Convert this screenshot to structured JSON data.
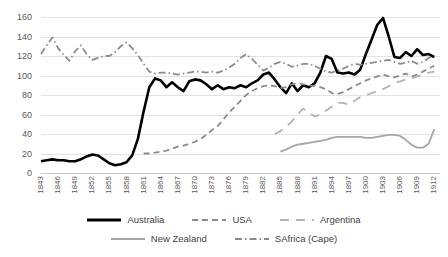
{
  "chart_data": {
    "type": "line",
    "title": "",
    "subtitle": "",
    "xlabel": "",
    "ylabel": "",
    "xlim": [
      1843,
      1913
    ],
    "ylim": [
      0,
      160
    ],
    "y_ticks": [
      0,
      20,
      40,
      60,
      80,
      100,
      120,
      140,
      160
    ],
    "grid": true,
    "legend_position": "bottom",
    "x_tick_labels": [
      "1843",
      "1846",
      "1849",
      "1852",
      "1855",
      "1858",
      "1861",
      "1864",
      "1867",
      "1870",
      "1873",
      "1876",
      "1879",
      "1882",
      "1885",
      "1888",
      "1891",
      "1894",
      "1897",
      "1900",
      "1903",
      "1906",
      "1909",
      "1912"
    ],
    "x_tick_values": [
      1843,
      1846,
      1849,
      1852,
      1855,
      1858,
      1861,
      1864,
      1867,
      1870,
      1873,
      1876,
      1879,
      1882,
      1885,
      1888,
      1891,
      1894,
      1897,
      1900,
      1903,
      1906,
      1909,
      1912
    ],
    "series": [
      {
        "name": "Australia",
        "color": "#000000",
        "style": "solid",
        "width": 2.6,
        "x": [
          1843,
          1844,
          1845,
          1846,
          1847,
          1848,
          1849,
          1850,
          1851,
          1852,
          1853,
          1854,
          1855,
          1856,
          1857,
          1858,
          1859,
          1860,
          1861,
          1862,
          1863,
          1864,
          1865,
          1866,
          1867,
          1868,
          1869,
          1870,
          1871,
          1872,
          1873,
          1874,
          1875,
          1876,
          1877,
          1878,
          1879,
          1880,
          1881,
          1882,
          1883,
          1884,
          1885,
          1886,
          1887,
          1888,
          1889,
          1890,
          1891,
          1892,
          1893,
          1894,
          1895,
          1896,
          1897,
          1898,
          1899,
          1900,
          1901,
          1902,
          1903,
          1904,
          1905,
          1906,
          1907,
          1908,
          1909,
          1910,
          1911,
          1912
        ],
        "y": [
          12,
          13,
          14,
          13,
          13,
          12,
          12,
          14,
          17,
          19,
          18,
          14,
          10,
          8,
          9,
          11,
          18,
          35,
          63,
          88,
          97,
          95,
          88,
          93,
          88,
          84,
          94,
          96,
          95,
          91,
          86,
          90,
          86,
          88,
          87,
          90,
          88,
          92,
          95,
          101,
          103,
          96,
          88,
          82,
          92,
          84,
          90,
          88,
          92,
          103,
          120,
          117,
          103,
          102,
          103,
          101,
          106,
          122,
          137,
          152,
          159,
          140,
          119,
          118,
          124,
          120,
          127,
          121,
          122,
          119
        ]
      },
      {
        "name": "USA",
        "color": "#8c8c8c",
        "style": "dashed",
        "width": 1.8,
        "x": [
          1861,
          1862,
          1863,
          1864,
          1865,
          1866,
          1867,
          1868,
          1869,
          1870,
          1871,
          1872,
          1873,
          1874,
          1875,
          1876,
          1877,
          1878,
          1879,
          1880,
          1881,
          1882,
          1883,
          1884,
          1885,
          1886,
          1887,
          1888,
          1889,
          1890,
          1891,
          1892,
          1893,
          1894,
          1895,
          1896,
          1897,
          1898,
          1899,
          1900,
          1901,
          1902,
          1903,
          1904,
          1905,
          1906,
          1907,
          1908,
          1909,
          1910,
          1911,
          1912
        ],
        "y": [
          20,
          20,
          21,
          22,
          23,
          25,
          27,
          28,
          30,
          32,
          35,
          39,
          44,
          48,
          55,
          62,
          68,
          74,
          80,
          84,
          87,
          89,
          90,
          89,
          87,
          88,
          91,
          92,
          91,
          90,
          89,
          88,
          86,
          82,
          81,
          83,
          86,
          89,
          92,
          95,
          97,
          99,
          101,
          99,
          98,
          100,
          102,
          99,
          101,
          104,
          107,
          110
        ]
      },
      {
        "name": "Argentina",
        "color": "#b3b3b3",
        "style": "longdash",
        "width": 1.8,
        "x": [
          1884,
          1885,
          1886,
          1887,
          1888,
          1889,
          1890,
          1891,
          1892,
          1893,
          1894,
          1895,
          1896,
          1897,
          1898,
          1899,
          1900,
          1901,
          1902,
          1903,
          1904,
          1905,
          1906,
          1907,
          1908,
          1909,
          1910,
          1911,
          1912
        ],
        "y": [
          40,
          43,
          47,
          53,
          60,
          66,
          62,
          58,
          60,
          64,
          68,
          72,
          72,
          70,
          74,
          78,
          80,
          82,
          84,
          86,
          89,
          92,
          94,
          96,
          97,
          99,
          101,
          103,
          104
        ]
      },
      {
        "name": "New Zealand",
        "color": "#a6a6a6",
        "style": "solid",
        "width": 1.8,
        "x": [
          1885,
          1886,
          1887,
          1888,
          1889,
          1890,
          1891,
          1892,
          1893,
          1894,
          1895,
          1896,
          1897,
          1898,
          1899,
          1900,
          1901,
          1902,
          1903,
          1904,
          1905,
          1906,
          1907,
          1908,
          1909,
          1910,
          1911,
          1912
        ],
        "y": [
          22,
          24,
          27,
          29,
          30,
          31,
          32,
          33,
          34,
          36,
          37,
          37,
          37,
          37,
          37,
          36,
          36,
          37,
          38,
          39,
          39,
          38,
          34,
          29,
          26,
          26,
          30,
          45
        ]
      },
      {
        "name": "SAfrica (Cape)",
        "color": "#8c8c8c",
        "style": "dashdot",
        "width": 1.8,
        "x": [
          1843,
          1844,
          1845,
          1846,
          1847,
          1848,
          1849,
          1850,
          1851,
          1852,
          1853,
          1854,
          1855,
          1856,
          1857,
          1858,
          1859,
          1860,
          1861,
          1862,
          1863,
          1864,
          1865,
          1866,
          1867,
          1868,
          1869,
          1870,
          1871,
          1872,
          1873,
          1874,
          1875,
          1876,
          1877,
          1878,
          1879,
          1880,
          1881,
          1882,
          1883,
          1884,
          1885,
          1886,
          1887,
          1888,
          1889,
          1890,
          1891,
          1892,
          1893,
          1894,
          1895,
          1896,
          1897,
          1898,
          1899,
          1900,
          1901,
          1902,
          1903,
          1904,
          1905,
          1906,
          1907,
          1908,
          1909,
          1910,
          1911,
          1912
        ],
        "y": [
          122,
          131,
          139,
          128,
          121,
          115,
          125,
          131,
          122,
          116,
          118,
          120,
          120,
          124,
          130,
          134,
          128,
          121,
          112,
          104,
          102,
          103,
          103,
          102,
          101,
          102,
          103,
          104,
          104,
          103,
          104,
          103,
          105,
          108,
          112,
          118,
          122,
          117,
          111,
          105,
          108,
          112,
          114,
          112,
          109,
          110,
          112,
          112,
          110,
          107,
          104,
          103,
          105,
          107,
          110,
          112,
          111,
          112,
          113,
          114,
          115,
          116,
          114,
          112,
          113,
          115,
          112,
          114,
          118,
          120
        ]
      }
    ]
  },
  "legend": {
    "items": [
      {
        "label": "Australia"
      },
      {
        "label": "USA"
      },
      {
        "label": "Argentina"
      },
      {
        "label": "New Zealand"
      },
      {
        "label": "SAfrica (Cape)"
      }
    ]
  }
}
